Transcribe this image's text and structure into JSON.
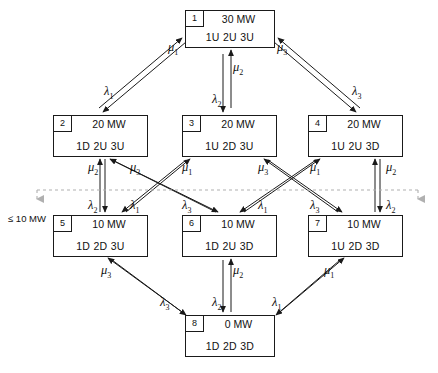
{
  "diagram": {
    "threshold_label": "≤ 10 MW",
    "colors": {
      "stroke": "#1a1a1a",
      "dashed": "#9a9a9a",
      "background": "#ffffff"
    },
    "nodes": [
      {
        "id": "1",
        "capacity": "30 MW",
        "state": "1U  2U  3U",
        "x": 185,
        "y": 10,
        "w": 90,
        "h": 38
      },
      {
        "id": "2",
        "capacity": "20 MW",
        "state": "1D  2U  3U",
        "x": 53,
        "y": 115,
        "w": 95,
        "h": 42
      },
      {
        "id": "3",
        "capacity": "20 MW",
        "state": "1U  2D  3U",
        "x": 182,
        "y": 115,
        "w": 95,
        "h": 42
      },
      {
        "id": "4",
        "capacity": "20 MW",
        "state": "1U  2U  3D",
        "x": 308,
        "y": 115,
        "w": 95,
        "h": 42
      },
      {
        "id": "5",
        "capacity": "10 MW",
        "state": "1D  2D  3U",
        "x": 53,
        "y": 215,
        "w": 95,
        "h": 42
      },
      {
        "id": "6",
        "capacity": "10 MW",
        "state": "1D  2U  3D",
        "x": 182,
        "y": 215,
        "w": 95,
        "h": 42
      },
      {
        "id": "7",
        "capacity": "10 MW",
        "state": "1U  2D  3D",
        "x": 308,
        "y": 215,
        "w": 95,
        "h": 42
      },
      {
        "id": "8",
        "capacity": "0 MW",
        "state": "1D  2D  3D",
        "x": 185,
        "y": 315,
        "w": 90,
        "h": 42
      }
    ],
    "edge_labels": [
      {
        "name": "lambda1-1to2",
        "text": "λ",
        "sub": "1",
        "x": 104,
        "y": 84
      },
      {
        "name": "mu1-2to1",
        "text": "μ",
        "sub": "1",
        "x": 168,
        "y": 40
      },
      {
        "name": "lambda2-1to3",
        "text": "λ",
        "sub": "2",
        "x": 212,
        "y": 92
      },
      {
        "name": "mu2-3to1",
        "text": "μ",
        "sub": "2",
        "x": 233,
        "y": 60
      },
      {
        "name": "lambda3-1to4",
        "text": "λ",
        "sub": "3",
        "x": 352,
        "y": 84
      },
      {
        "name": "mu3-4to1",
        "text": "μ",
        "sub": "3",
        "x": 277,
        "y": 40
      },
      {
        "name": "mu2-5to2",
        "text": "μ",
        "sub": "2",
        "x": 88,
        "y": 160
      },
      {
        "name": "mu3-6to2",
        "text": "μ",
        "sub": "3",
        "x": 130,
        "y": 160
      },
      {
        "name": "mu1-5to3",
        "text": "μ",
        "sub": "1",
        "x": 182,
        "y": 160
      },
      {
        "name": "mu3-7to3",
        "text": "μ",
        "sub": "3",
        "x": 258,
        "y": 160
      },
      {
        "name": "mu1-6to4",
        "text": "μ",
        "sub": "1",
        "x": 310,
        "y": 160
      },
      {
        "name": "mu2-7to4",
        "text": "μ",
        "sub": "2",
        "x": 386,
        "y": 160
      },
      {
        "name": "lambda2-2to5",
        "text": "λ",
        "sub": "2",
        "x": 88,
        "y": 198
      },
      {
        "name": "lambda1-3to5",
        "text": "λ",
        "sub": "1",
        "x": 130,
        "y": 198
      },
      {
        "name": "lambda3-2to6",
        "text": "λ",
        "sub": "3",
        "x": 182,
        "y": 198
      },
      {
        "name": "lambda1-4to6",
        "text": "λ",
        "sub": "1",
        "x": 258,
        "y": 198
      },
      {
        "name": "lambda3-3to7",
        "text": "λ",
        "sub": "3",
        "x": 310,
        "y": 198
      },
      {
        "name": "lambda2-4to7",
        "text": "λ",
        "sub": "2",
        "x": 386,
        "y": 198
      },
      {
        "name": "mu3-8to5",
        "text": "μ",
        "sub": "3",
        "x": 101,
        "y": 263
      },
      {
        "name": "mu2-8to6",
        "text": "μ",
        "sub": "2",
        "x": 233,
        "y": 263
      },
      {
        "name": "mu1-8to7",
        "text": "μ",
        "sub": "1",
        "x": 324,
        "y": 263
      },
      {
        "name": "lambda3-5to8",
        "text": "λ",
        "sub": "3",
        "x": 160,
        "y": 295
      },
      {
        "name": "lambda2-6to8",
        "text": "λ",
        "sub": "2",
        "x": 212,
        "y": 295
      },
      {
        "name": "lambda1-7to8",
        "text": "λ",
        "sub": "1",
        "x": 272,
        "y": 295
      }
    ]
  }
}
